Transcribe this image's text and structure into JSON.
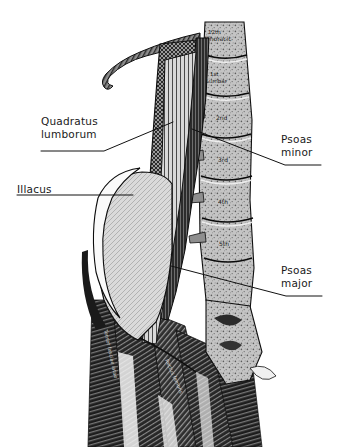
{
  "figure": {
    "kind": "anatomical-engraving",
    "background_color": "#ffffff",
    "ink_color": "#1a1a1a"
  },
  "labels": [
    {
      "id": "quadratus-lumborum",
      "line1": "Quadratus",
      "line2": "lumborum",
      "side": "left"
    },
    {
      "id": "illacus",
      "line1": "Illacus",
      "line2": "",
      "side": "left"
    },
    {
      "id": "psoas-minor",
      "line1": "Psoas",
      "line2": "minor",
      "side": "right"
    },
    {
      "id": "psoas-major",
      "line1": "Psoas",
      "line2": "major",
      "side": "right"
    }
  ],
  "bone_inscriptions": [
    {
      "id": "t12",
      "text": "12th Thoracic"
    },
    {
      "id": "l1",
      "text": "1st Lumbar"
    },
    {
      "id": "l2",
      "text": "2nd"
    },
    {
      "id": "l3",
      "text": "3rd"
    },
    {
      "id": "l4",
      "text": "4th"
    },
    {
      "id": "l5",
      "text": "5th"
    }
  ],
  "muscle_inscriptions": [
    {
      "id": "tensor-fasciae-latae",
      "text": "Tensor fasciae latae"
    },
    {
      "id": "rectus-femoris",
      "text": "Rectus femoris"
    }
  ],
  "colors": {
    "ink": "#1a1a1a",
    "iliacus_fill": "#d9d9d9",
    "quadratus_fill": "#8f8f8f",
    "psoas_minor_fill": "#3a3a3a",
    "psoas_major_fill": "#c9c9c9",
    "bone_fill": "#bdbdbd",
    "leader_line": "#111111"
  }
}
